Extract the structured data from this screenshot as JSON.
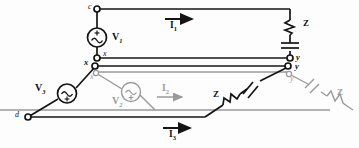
{
  "figure": {
    "type": "electrical-circuit-diagram",
    "colors": {
      "foreground": "#141414",
      "background_layer": "#9a9a9a",
      "paper": "#fdfdfd"
    }
  },
  "nodes": [
    {
      "id": "node-c",
      "label": "c",
      "layer": "front"
    },
    {
      "id": "node-x-upper",
      "label": "x",
      "layer": "front"
    },
    {
      "id": "node-x-mid",
      "label": "x",
      "layer": "front"
    },
    {
      "id": "node-x-back",
      "label": "x",
      "layer": "back"
    },
    {
      "id": "node-y-upper",
      "label": "y",
      "layer": "front"
    },
    {
      "id": "node-y-mid",
      "label": "y",
      "layer": "front"
    },
    {
      "id": "node-y-back",
      "label": "y",
      "layer": "back"
    },
    {
      "id": "node-d",
      "label": "d",
      "layer": "front"
    }
  ],
  "sources": [
    {
      "id": "source-v1",
      "label": "V",
      "subscript": "1",
      "polarity": "+",
      "symbol": "ac-sine",
      "layer": "front"
    },
    {
      "id": "source-v2",
      "label": "V",
      "subscript": "2",
      "polarity": "+",
      "symbol": "ac-sine",
      "layer": "back"
    },
    {
      "id": "source-v3",
      "label": "V",
      "subscript": "3",
      "polarity": "+",
      "symbol": "ac-sine",
      "layer": "front"
    }
  ],
  "impedances": [
    {
      "id": "impedance-z-right",
      "label": "Z",
      "elements": [
        "resistor",
        "capacitor"
      ],
      "orientation": "vertical",
      "layer": "front"
    },
    {
      "id": "impedance-z-middle",
      "label": "Z",
      "elements": [
        "resistor",
        "capacitor"
      ],
      "orientation": "diagonal",
      "layer": "front"
    },
    {
      "id": "impedance-z-back",
      "label": "Z",
      "elements": [
        "capacitor",
        "resistor"
      ],
      "orientation": "diagonal",
      "layer": "back"
    }
  ],
  "currents": [
    {
      "id": "current-i1",
      "label": "I",
      "subscript": "1",
      "direction": "right",
      "layer": "front"
    },
    {
      "id": "current-i2",
      "label": "I",
      "subscript": "2",
      "direction": "right",
      "layer": "back"
    },
    {
      "id": "current-i3",
      "label": "I",
      "subscript": "3",
      "direction": "right",
      "layer": "front"
    }
  ]
}
